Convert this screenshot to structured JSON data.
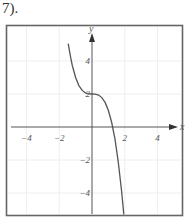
{
  "problem": {
    "number_label": "7)."
  },
  "chart_data": {
    "type": "line",
    "title": "",
    "function": "y = -x^3 + 2",
    "xlabel": "x",
    "ylabel": "y",
    "xlim": [
      -5.2,
      5.5
    ],
    "ylim": [
      -5.4,
      6.2
    ],
    "x_ticks": [
      -4,
      -2,
      2,
      4
    ],
    "x_tick_labels": [
      "−4",
      "−2",
      "2",
      "4"
    ],
    "y_ticks": [
      4,
      2,
      -2,
      -4
    ],
    "y_tick_labels": [
      "4",
      "2",
      "−2",
      "−4"
    ],
    "grid": true,
    "series": [
      {
        "name": "f(x)",
        "x": [
          -1.45,
          -1.3,
          -1.2,
          -1.0,
          -0.8,
          -0.6,
          -0.4,
          -0.2,
          0,
          0.2,
          0.4,
          0.6,
          0.8,
          1.0,
          1.2,
          1.4,
          1.6,
          1.8,
          1.94
        ],
        "y": [
          5.05,
          4.2,
          3.73,
          3.0,
          2.51,
          2.22,
          2.06,
          2.01,
          2.0,
          1.99,
          1.94,
          1.78,
          1.49,
          1.0,
          0.27,
          -0.74,
          -2.1,
          -3.83,
          -5.3
        ]
      }
    ],
    "key_points": {
      "inflection": [
        0,
        2
      ],
      "x_intercept": 1.26,
      "y_intercept": 2
    }
  },
  "style": {
    "axis_color": "#555555",
    "curve_color": "#555555",
    "frame_color": "#666666",
    "grid_color": "#eeeeee"
  }
}
